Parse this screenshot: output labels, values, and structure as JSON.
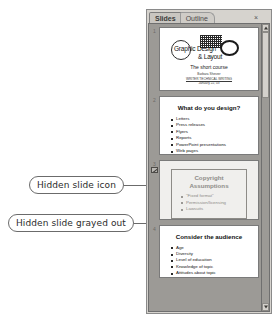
{
  "callouts": [
    {
      "id": "hidden-slide-icon",
      "label": "Hidden slide icon"
    },
    {
      "id": "hidden-slide-grayed",
      "label": "Hidden slide grayed out"
    }
  ],
  "panel": {
    "tabs": [
      {
        "label": "Slides",
        "active": true
      },
      {
        "label": "Outline",
        "active": false
      }
    ],
    "close_icon": "×",
    "scrollbar": {
      "up_icon": "scroll-up-arrow",
      "down_icon": "scroll-down-arrow"
    }
  },
  "slides": [
    {
      "number": "1",
      "hidden": false,
      "type": "title",
      "logo": {
        "text_line1": "Graphic Design",
        "text_line2": "& Layout",
        "shapes": [
          "circle-outline",
          "checkered-square",
          "bold-ring"
        ]
      },
      "subtitle": "The short course",
      "byline_line1": "Barbara   Sherzer",
      "byline_line2": "WRITER   TECHNICAL WRITING",
      "byline_line3": "January 22, 03"
    },
    {
      "number": "2",
      "hidden": false,
      "type": "content",
      "title": "What do you design?",
      "bullets": [
        "Letters",
        "Press releases",
        "Flyers",
        "Reports",
        "PowerPoint presentations",
        "Web pages"
      ]
    },
    {
      "number": "3",
      "hidden": true,
      "type": "content-boxed",
      "title": "Copyright Assumptions",
      "bullets": [
        "\"Fixed format\"",
        "Permission/licensing",
        "Lawsuits"
      ]
    },
    {
      "number": "4",
      "hidden": false,
      "type": "content",
      "title": "Consider the audience",
      "bullets": [
        "Age",
        "Diversity",
        "Level of education",
        "Knowledge of topic",
        "Attitudes about topic"
      ]
    }
  ],
  "colors": {
    "panel_background": "#d6d3ce",
    "list_background": "#9c9a96",
    "slide_white": "#ffffff",
    "slide_grayed": "#f0efed",
    "callout_stroke": "#6b6b6b",
    "text_dark": "#101010"
  }
}
